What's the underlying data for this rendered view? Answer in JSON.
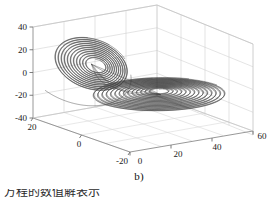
{
  "figure": {
    "caption": "b)",
    "page_text_fragment": "方程的数值解表示",
    "background_color": "#ffffff",
    "line_color": "#2b2b2b",
    "grid_color": "#cfcfcf",
    "axis_color": "#808080",
    "tick_label_color": "#1a1a1a"
  },
  "chart_data": {
    "type": "line",
    "title": "",
    "subtitle": "",
    "projection": "3d",
    "xlabel": "",
    "ylabel": "",
    "zlabel": "",
    "xticks": [
      0,
      20,
      40,
      60
    ],
    "yticks": [
      20,
      0,
      -20
    ],
    "zticks": [
      40,
      20,
      0,
      -20,
      -40
    ],
    "xlim": [
      0,
      60
    ],
    "ylim": [
      -20,
      20
    ],
    "zlim": [
      -40,
      40
    ],
    "grid": true,
    "legend": "none",
    "annotations": [
      "b)"
    ],
    "series": [
      {
        "name": "trajectory",
        "color": "#2b2b2b",
        "lobes": [
          {
            "name": "upper-left-scroll",
            "center_xyz": [
              12,
              6,
              14
            ],
            "turns": 11,
            "radius_outer": 17,
            "radius_inner": 4
          },
          {
            "name": "right-flat-spiral",
            "center_xyz": [
              36,
              -2,
              -14
            ],
            "turns": 14,
            "radius_outer": 26,
            "radius_inner": 3
          }
        ]
      }
    ]
  }
}
